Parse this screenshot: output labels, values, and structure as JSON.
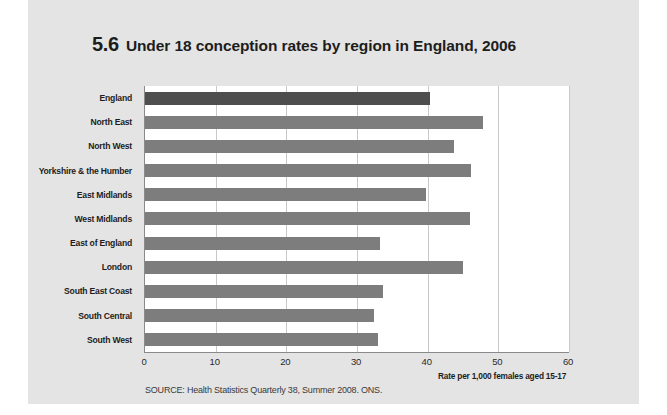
{
  "figure": {
    "number": "5.6",
    "title": "Under 18 conception rates by region in England, 2006",
    "source": "SOURCE: Health Statistics Quarterly 38, Summer 2008. ONS."
  },
  "colors": {
    "page_background": "#e4e4e4",
    "plot_background": "#ffffff",
    "bar": "#7d7d7d",
    "bar_highlight": "#4e4e4e",
    "gridline": "#c9c9c9",
    "axis": "#8a8a8a",
    "text": "#1d1d1d"
  },
  "chart_data": {
    "type": "bar",
    "orientation": "horizontal",
    "title": "Under 18 conception rates by region in England, 2006",
    "xlabel": "Rate per 1,000 females aged 15-17",
    "ylabel": "",
    "xlim": [
      0,
      60
    ],
    "xticks": [
      "0",
      "10",
      "20",
      "30",
      "40",
      "50",
      "60"
    ],
    "xtick_values": [
      0,
      10,
      20,
      30,
      40,
      50,
      60
    ],
    "grid": "vertical",
    "legend": "none",
    "categories": [
      "England",
      "North East",
      "North West",
      "Yorkshire & the Humber",
      "East Midlands",
      "West Midlands",
      "East of England",
      "London",
      "South East Coast",
      "South Central",
      "South West"
    ],
    "values": [
      40.4,
      47.8,
      43.7,
      46.2,
      39.7,
      46.0,
      33.2,
      45.0,
      33.7,
      32.4,
      33.0
    ],
    "highlight_index": 0,
    "highlight_note": "England (national average) drawn in darker grey"
  }
}
